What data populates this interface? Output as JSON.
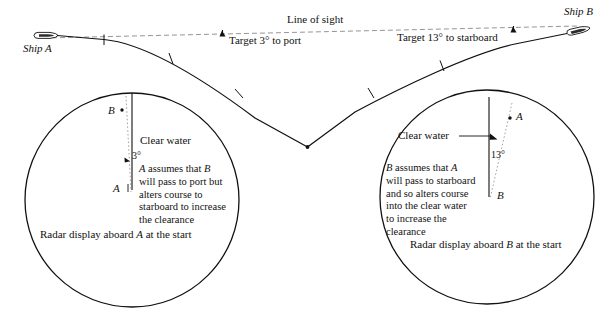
{
  "figure": {
    "title_visible": false,
    "type": "nautical-collision-avoidance-diagram",
    "background_color": "#ffffff",
    "line_color": "#111111"
  },
  "top_scene": {
    "line_of_sight_label": "Line of sight",
    "ship_a_label": "Ship A",
    "ship_b_label": "Ship B",
    "target_port_label": "Target 3° to port",
    "target_starboard_label": "Target 13° to starboard"
  },
  "radar_left": {
    "caption": "Radar display aboard A at the start",
    "clear_water_label": "Clear water",
    "own_ship_label": "A",
    "target_label": "B",
    "angle_label": "3°",
    "note_lines": [
      "A assumes that B",
      "will pass to port but",
      "alters course to",
      "starboard to increase",
      "the clearance"
    ]
  },
  "radar_right": {
    "caption": "Radar display aboard B at the start",
    "clear_water_label": "Clear water",
    "own_ship_label": "B",
    "target_label": "A",
    "angle_label": "13°",
    "note_lines": [
      "B assumes that A",
      "will pass to starboard",
      "and so alters course",
      "into the clear water",
      "to increase the",
      "clearance"
    ]
  },
  "icons": {
    "ship_a": "ship-hull-icon",
    "ship_b": "ship-hull-icon",
    "arrow_port": "arrowhead-icon",
    "arrow_starboard": "arrowhead-icon",
    "left_radar_arrow": "course-arrow-icon",
    "right_radar_arrow": "course-arrow-icon"
  }
}
